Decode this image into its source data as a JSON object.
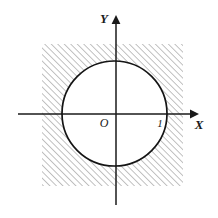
{
  "figure": {
    "kind": "math-diagram",
    "background_color": "#ffffff",
    "width": 218,
    "height": 218
  },
  "axes": {
    "x": {
      "label": "X",
      "color": "#1a1a1a",
      "start_x": 18,
      "end_x": 196,
      "y": 114,
      "arrow": "right-arrowhead"
    },
    "y": {
      "label": "Y",
      "color": "#1a1a1a",
      "x": 116,
      "start_y": 205,
      "end_y": 17,
      "arrow": "up-arrowhead"
    },
    "origin_label": "O"
  },
  "ticks": [
    {
      "label": "1",
      "axis": "x",
      "value": 1,
      "px_x": 167,
      "px_y": 114
    }
  ],
  "circle": {
    "center_x": 0,
    "center_y": 0,
    "radius": 1,
    "px_center_x": 114.5,
    "px_center_y": 113.5,
    "px_radius": 52.5,
    "stroke_color": "#141414",
    "stroke_width": 1.7,
    "fill_color": "#ffffff"
  },
  "hatched_region": {
    "description": "square region minus the circle interior",
    "shape": "square",
    "px_left": 42,
    "px_top": 44,
    "px_right": 183,
    "px_bottom": 186,
    "hatch_angle_deg": 45,
    "hatch_spacing_px": 4.6,
    "hatch_color": "#6e6e6e",
    "hatch_line_width": 0.85,
    "fill_color": "none"
  }
}
